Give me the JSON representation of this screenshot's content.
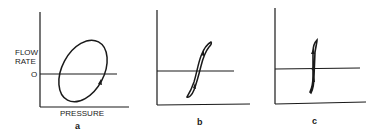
{
  "figure": {
    "panels": [
      {
        "id": "a",
        "caption": "a",
        "y_axis_label_line1": "FLOW",
        "y_axis_label_line2": "RATE",
        "x_axis_label": "PRESSURE",
        "zero_label": "O",
        "curve": "tilted ellipse loop with arrow"
      },
      {
        "id": "b",
        "caption": "b",
        "curve": "narrow S-shaped hysteresis loop with arrows"
      },
      {
        "id": "c",
        "caption": "c",
        "curve": "near-vertical narrow loop with arrows crossing zero line"
      }
    ],
    "colors": {
      "ink": "#1a1a1a",
      "background": "#ffffff"
    }
  }
}
